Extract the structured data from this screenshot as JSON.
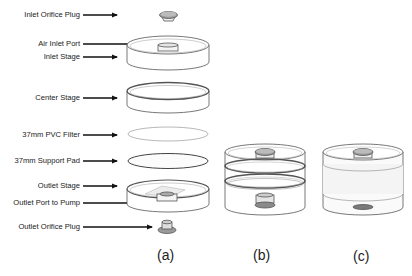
{
  "diagram": {
    "type": "exploded-assembly",
    "labels": [
      {
        "id": "inlet-orifice-plug",
        "text": "Inlet Orifice Plug"
      },
      {
        "id": "air-inlet-port",
        "text": "Air Inlet Port"
      },
      {
        "id": "inlet-stage",
        "text": "Inlet Stage"
      },
      {
        "id": "center-stage",
        "text": "Center Stage"
      },
      {
        "id": "pvc-filter",
        "text": "37mm PVC Filter"
      },
      {
        "id": "support-pad",
        "text": "37mm Support Pad"
      },
      {
        "id": "outlet-stage",
        "text": "Outlet Stage"
      },
      {
        "id": "outlet-port",
        "text": "Outlet Port to Pump"
      },
      {
        "id": "outlet-orifice-plug",
        "text": "Outlet Orifice Plug"
      }
    ],
    "captions": {
      "a": "(a)",
      "b": "(b)",
      "c": "(c)"
    },
    "colors": {
      "line": "#555555",
      "arrow": "#111111",
      "plug": "#9a9a9a",
      "plug_dark": "#777777",
      "fill": "#ffffff",
      "tint": "#f3f3f3"
    }
  }
}
